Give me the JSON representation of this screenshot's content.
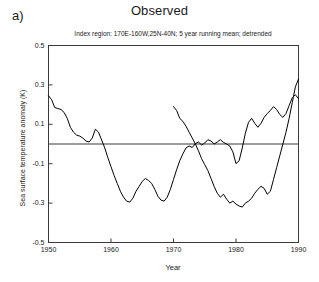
{
  "panel": {
    "letter": "a)"
  },
  "title": "Observed",
  "subtitle": "Index region: 170E-160W,25N-40N; 5 year running mean; detrended",
  "axes": {
    "x_title": "Year",
    "y_title": "Sea surface temperature anomaly (K)"
  },
  "chart_data": {
    "type": "line",
    "title": "Observed",
    "subtitle": "Index region: 170E-160W,25N-40N; 5 year running mean; detrended",
    "xlabel": "Year",
    "ylabel": "Sea surface temperature anomaly (K)",
    "xlim": [
      1950,
      1990
    ],
    "ylim": [
      -0.5,
      0.5
    ],
    "xticks": [
      1950,
      1960,
      1970,
      1980,
      1990
    ],
    "xtick_labels": [
      "1950",
      "1960",
      "1970",
      "1980",
      "1990"
    ],
    "yticks": [
      -0.5,
      -0.3,
      -0.1,
      0.1,
      0.3,
      0.5
    ],
    "ytick_labels": [
      "-0.5",
      "-0.3",
      "-0.1",
      "0.1",
      "0.3",
      "0.5"
    ],
    "grid": false,
    "legend": null,
    "zero_line": 0.0,
    "line_color": "#000000",
    "series": [
      {
        "name": "Sea surface temperature anomaly",
        "x": [
          1950.0,
          1950.5,
          1951.0,
          1951.5,
          1952.0,
          1952.5,
          1953.0,
          1953.5,
          1954.0,
          1954.5,
          1955.0,
          1955.5,
          1956.0,
          1956.5,
          1957.0,
          1957.5,
          1958.0,
          1958.5,
          1959.0,
          1959.5,
          1960.0,
          1960.5,
          1961.0,
          1961.5,
          1962.0,
          1962.5,
          1963.0,
          1963.5,
          1964.0,
          1964.5,
          1965.0,
          1965.5,
          1966.0,
          1966.5,
          1967.0,
          1967.5,
          1968.0,
          1968.5,
          1969.0,
          1969.5,
          1970.0,
          1970.5,
          1971.0,
          1971.5,
          1972.0,
          1972.5,
          1973.0,
          1973.5,
          1974.0,
          1974.5,
          1975.0,
          1975.5,
          1976.0,
          1976.5,
          1977.0,
          1977.5,
          1978.0,
          1978.5,
          1979.0,
          1979.5,
          1980.0,
          1980.5,
          1981.0,
          1981.5,
          1982.0,
          1982.5,
          1983.0,
          1983.5,
          1984.0,
          1984.5,
          1985.0,
          1985.5,
          1986.0,
          1986.5,
          1987.0,
          1987.5,
          1988.0,
          1988.5,
          1989.0,
          1989.5,
          1990.0
        ],
        "y": [
          0.245,
          0.225,
          0.185,
          0.18,
          0.175,
          0.16,
          0.13,
          0.085,
          0.06,
          0.045,
          0.04,
          0.03,
          0.015,
          0.01,
          0.03,
          0.075,
          0.06,
          0.02,
          -0.02,
          -0.07,
          -0.115,
          -0.16,
          -0.2,
          -0.24,
          -0.27,
          -0.29,
          -0.295,
          -0.275,
          -0.24,
          -0.215,
          -0.19,
          -0.175,
          -0.185,
          -0.2,
          -0.23,
          -0.265,
          -0.285,
          -0.29,
          -0.27,
          -0.23,
          -0.18,
          -0.13,
          -0.085,
          -0.05,
          -0.02,
          -0.01,
          -0.018,
          0.002,
          0.01,
          -0.005,
          0.005,
          0.022,
          0.015,
          0.0,
          0.01,
          0.022,
          0.008,
          0.0,
          -0.01,
          -0.04,
          -0.1,
          -0.085,
          -0.02,
          0.055,
          0.11,
          0.13,
          0.105,
          0.085,
          0.105,
          0.135,
          0.155,
          0.17,
          0.19,
          0.175,
          0.15,
          0.135,
          0.155,
          0.195,
          0.235,
          0.25,
          0.23
        ]
      },
      {
        "name": "second-half",
        "x": [
          1970.0,
          1970.5,
          1971.0,
          1971.5,
          1972.0,
          1972.5,
          1973.0,
          1973.5,
          1974.0,
          1974.5,
          1975.0,
          1975.5,
          1976.0,
          1976.5,
          1977.0,
          1977.5,
          1978.0,
          1978.5,
          1979.0,
          1979.5,
          1980.0,
          1980.5,
          1981.0,
          1981.5,
          1982.0,
          1982.5,
          1983.0,
          1983.5,
          1984.0,
          1984.5,
          1985.0,
          1985.5,
          1986.0,
          1986.5,
          1987.0,
          1987.5,
          1988.0,
          1988.5,
          1989.0,
          1989.5,
          1990.0
        ],
        "y": [
          0.19,
          0.17,
          0.13,
          0.115,
          0.09,
          0.06,
          0.03,
          0.0,
          -0.035,
          -0.075,
          -0.105,
          -0.135,
          -0.175,
          -0.215,
          -0.25,
          -0.27,
          -0.255,
          -0.28,
          -0.3,
          -0.29,
          -0.305,
          -0.315,
          -0.32,
          -0.3,
          -0.29,
          -0.275,
          -0.25,
          -0.23,
          -0.215,
          -0.225,
          -0.255,
          -0.24,
          -0.18,
          -0.12,
          -0.06,
          0.0,
          0.06,
          0.13,
          0.21,
          0.29,
          0.33
        ]
      }
    ]
  }
}
